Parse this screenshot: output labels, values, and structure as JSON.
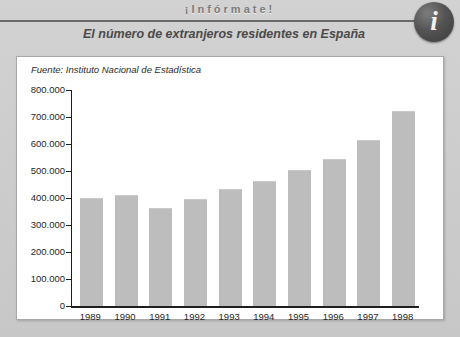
{
  "header": {
    "kicker": "¡Infórmate!",
    "subtitle": "El número de extranjeros residentes en España",
    "info_icon_letter": "i"
  },
  "panel": {
    "source": "Fuente: Instituto Nacional de Estadística"
  },
  "colors": {
    "bar": "#bdbdbd",
    "axis": "#1f1f1f",
    "panel_background": "#ffffff",
    "poster_background": "#c9c9c9",
    "rule": "#6a6a6a",
    "badge": "#4a4a4a"
  },
  "chart_data": {
    "type": "bar",
    "title": "El número de extranjeros residentes en España",
    "subtitle": "Fuente: Instituto Nacional de Estadística",
    "xlabel": "",
    "ylabel": "",
    "categories": [
      "1989",
      "1990",
      "1991",
      "1992",
      "1993",
      "1994",
      "1995",
      "1996",
      "1997",
      "1998"
    ],
    "values": [
      398000,
      408000,
      360000,
      393000,
      430000,
      461000,
      500000,
      539000,
      610000,
      720000
    ],
    "ylim": [
      0,
      800000
    ],
    "ytick_values": [
      0,
      100000,
      200000,
      300000,
      400000,
      500000,
      600000,
      700000,
      800000
    ],
    "ytick_labels": [
      "0",
      "100.000",
      "200.000",
      "300.000",
      "400.000",
      "500.000",
      "600.000",
      "700.000",
      "800.000"
    ],
    "grid": false,
    "legend": null
  }
}
